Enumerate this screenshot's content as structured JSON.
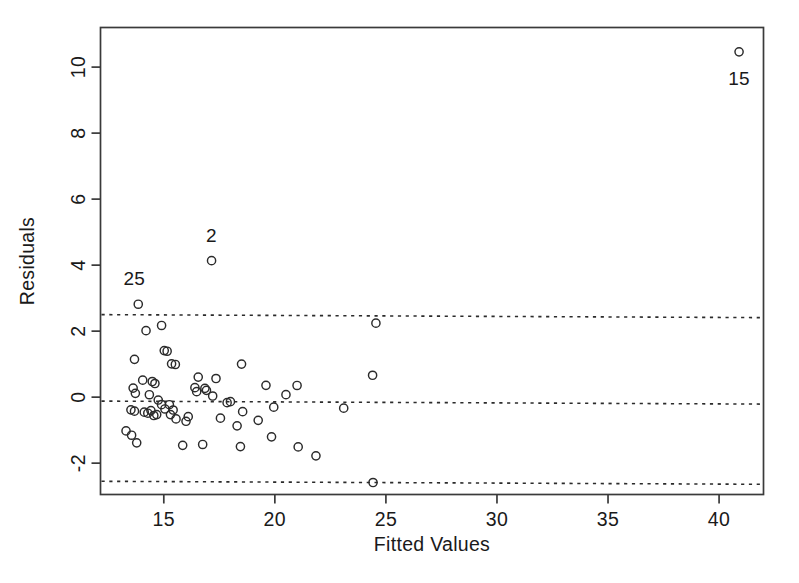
{
  "chart_data": {
    "type": "scatter",
    "title": "",
    "xlabel": "Fitted Values",
    "ylabel": "Residuals",
    "xlim": [
      12.15,
      42.0
    ],
    "ylim": [
      -2.95,
      11.2
    ],
    "xticks": [
      15,
      20,
      25,
      30,
      35,
      40
    ],
    "yticks": [
      -2,
      0,
      2,
      4,
      6,
      8,
      10
    ],
    "xtick_labels": [
      "15",
      "20",
      "25",
      "30",
      "35",
      "40"
    ],
    "ytick_labels": [
      "-2",
      "0",
      "2",
      "4",
      "6",
      "8",
      "10"
    ],
    "grid": false,
    "legend": "none",
    "marker": "open-circle",
    "reference_lines": [
      {
        "name": "upper-band",
        "y": 2.5,
        "style": "dashed"
      },
      {
        "name": "mean-line",
        "y": -0.12,
        "style": "dashed"
      },
      {
        "name": "lower-band",
        "y": -2.55,
        "style": "dashed"
      }
    ],
    "annotations": [
      {
        "label": "15",
        "x": 40.9,
        "y": 10.55,
        "dx": 0,
        "dy": -1.0
      },
      {
        "label": "2",
        "x": 17.15,
        "y": 4.15,
        "dx": 0,
        "dy": 0.58
      },
      {
        "label": "25",
        "x": 13.85,
        "y": 2.82,
        "dx": -0.18,
        "dy": 0.58
      }
    ],
    "points": [
      {
        "x": 40.9,
        "y": 10.55
      },
      {
        "x": 17.15,
        "y": 4.15
      },
      {
        "x": 13.85,
        "y": 2.82
      },
      {
        "x": 14.9,
        "y": 2.18
      },
      {
        "x": 14.2,
        "y": 2.02
      },
      {
        "x": 24.55,
        "y": 2.28
      },
      {
        "x": 15.02,
        "y": 1.42
      },
      {
        "x": 15.15,
        "y": 1.4
      },
      {
        "x": 13.68,
        "y": 1.15
      },
      {
        "x": 15.35,
        "y": 1.02
      },
      {
        "x": 15.52,
        "y": 1.0
      },
      {
        "x": 18.5,
        "y": 1.02
      },
      {
        "x": 14.05,
        "y": 0.52
      },
      {
        "x": 14.48,
        "y": 0.48
      },
      {
        "x": 14.6,
        "y": 0.42
      },
      {
        "x": 16.55,
        "y": 0.62
      },
      {
        "x": 17.35,
        "y": 0.58
      },
      {
        "x": 13.62,
        "y": 0.28
      },
      {
        "x": 13.72,
        "y": 0.12
      },
      {
        "x": 16.4,
        "y": 0.3
      },
      {
        "x": 16.48,
        "y": 0.18
      },
      {
        "x": 16.85,
        "y": 0.28
      },
      {
        "x": 16.92,
        "y": 0.22
      },
      {
        "x": 19.6,
        "y": 0.38
      },
      {
        "x": 21.0,
        "y": 0.38
      },
      {
        "x": 24.4,
        "y": 0.7
      },
      {
        "x": 20.5,
        "y": 0.1
      },
      {
        "x": 14.75,
        "y": -0.08
      },
      {
        "x": 14.9,
        "y": -0.22
      },
      {
        "x": 15.25,
        "y": -0.22
      },
      {
        "x": 15.05,
        "y": -0.35
      },
      {
        "x": 18.0,
        "y": -0.12
      },
      {
        "x": 17.85,
        "y": -0.15
      },
      {
        "x": 19.95,
        "y": -0.28
      },
      {
        "x": 13.52,
        "y": -0.38
      },
      {
        "x": 13.68,
        "y": -0.42
      },
      {
        "x": 14.12,
        "y": -0.45
      },
      {
        "x": 14.28,
        "y": -0.48
      },
      {
        "x": 14.42,
        "y": -0.4
      },
      {
        "x": 14.55,
        "y": -0.55
      },
      {
        "x": 14.68,
        "y": -0.52
      },
      {
        "x": 15.3,
        "y": -0.52
      },
      {
        "x": 15.42,
        "y": -0.38
      },
      {
        "x": 15.55,
        "y": -0.65
      },
      {
        "x": 16.1,
        "y": -0.58
      },
      {
        "x": 16.0,
        "y": -0.72
      },
      {
        "x": 17.55,
        "y": -0.62
      },
      {
        "x": 18.55,
        "y": -0.42
      },
      {
        "x": 23.1,
        "y": -0.3
      },
      {
        "x": 13.3,
        "y": -1.02
      },
      {
        "x": 13.55,
        "y": -1.15
      },
      {
        "x": 13.78,
        "y": -1.38
      },
      {
        "x": 18.3,
        "y": -0.85
      },
      {
        "x": 19.25,
        "y": -0.68
      },
      {
        "x": 19.85,
        "y": -1.18
      },
      {
        "x": 18.45,
        "y": -1.48
      },
      {
        "x": 21.05,
        "y": -1.48
      },
      {
        "x": 21.85,
        "y": -1.75
      },
      {
        "x": 24.42,
        "y": -2.55
      },
      {
        "x": 16.75,
        "y": -1.42
      },
      {
        "x": 15.85,
        "y": -1.45
      },
      {
        "x": 14.35,
        "y": 0.08
      },
      {
        "x": 17.2,
        "y": 0.05
      }
    ]
  },
  "axes": {
    "y_axis_title": "Residuals",
    "x_axis_title": "Fitted Values"
  }
}
